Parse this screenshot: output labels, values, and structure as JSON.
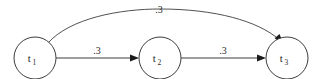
{
  "diagram": {
    "type": "directed-graph",
    "background_color": "#ffffff",
    "stroke_color": "#3d3d3d",
    "text_color": "#2b2b2b",
    "nodes": [
      {
        "id": "t1",
        "base": "t",
        "subscript": "1",
        "cx": 35,
        "cy": 58,
        "r": 21
      },
      {
        "id": "t2",
        "base": "t",
        "subscript": "2",
        "cx": 160,
        "cy": 58,
        "r": 21
      },
      {
        "id": "t3",
        "base": "t",
        "subscript": "3",
        "cx": 287,
        "cy": 58,
        "r": 21
      }
    ],
    "edges": [
      {
        "id": "e1",
        "from": "t1",
        "to": "t2",
        "label": ".3",
        "shape": "straight",
        "label_x": 97,
        "label_y": 54
      },
      {
        "id": "e2",
        "from": "t2",
        "to": "t3",
        "label": ".3",
        "shape": "straight",
        "label_x": 223,
        "label_y": 54
      },
      {
        "id": "e3",
        "from": "t1",
        "to": "t3",
        "label": ".3",
        "shape": "curved",
        "label_x": 159,
        "label_y": 13
      }
    ]
  }
}
